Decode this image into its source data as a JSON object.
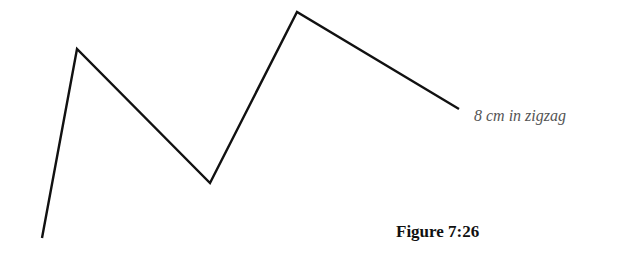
{
  "figure": {
    "caption": "Figure 7:26",
    "label": "8 cm in zigzag",
    "line_color": "#111111",
    "zigzag_points": "42,238 77,49 210,183 297,12 459,109"
  }
}
